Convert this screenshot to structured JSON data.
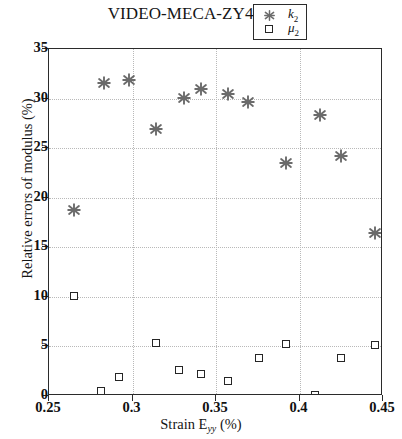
{
  "chart_data": {
    "type": "scatter",
    "title": "VIDEO-MECA-ZY4 N°81",
    "xlabel": "Strain E",
    "xlabel_sub": "yy",
    "xlabel_unit": "(%)",
    "ylabel": "Relative errors of modulus (%)",
    "xlim": [
      0.25,
      0.45
    ],
    "ylim": [
      0,
      35
    ],
    "xticks": [
      "0.25",
      "0.3",
      "0.35",
      "0.4",
      "0.45"
    ],
    "xtick_values": [
      0.25,
      0.3,
      0.35,
      0.4,
      0.45
    ],
    "yticks": [
      "0",
      "5",
      "10",
      "15",
      "20",
      "25",
      "30",
      "35"
    ],
    "ytick_values": [
      0,
      5,
      10,
      15,
      20,
      25,
      30,
      35
    ],
    "grid": true,
    "legend_position": "top-right",
    "series": [
      {
        "name": "k₂",
        "label": "k",
        "label_sub": "2",
        "marker": "asterisk",
        "color": "#6b6b6b",
        "points": [
          {
            "x": 0.265,
            "y": 18.8
          },
          {
            "x": 0.283,
            "y": 31.6
          },
          {
            "x": 0.298,
            "y": 31.9
          },
          {
            "x": 0.314,
            "y": 26.9
          },
          {
            "x": 0.331,
            "y": 30.1
          },
          {
            "x": 0.341,
            "y": 31.0
          },
          {
            "x": 0.357,
            "y": 30.5
          },
          {
            "x": 0.369,
            "y": 29.7
          },
          {
            "x": 0.392,
            "y": 23.5
          },
          {
            "x": 0.412,
            "y": 28.3
          },
          {
            "x": 0.425,
            "y": 24.2
          },
          {
            "x": 0.445,
            "y": 16.4
          }
        ]
      },
      {
        "name": "μ₂",
        "label": "μ",
        "label_sub": "2",
        "marker": "square",
        "color": "#262626",
        "points": [
          {
            "x": 0.265,
            "y": 10.1
          },
          {
            "x": 0.281,
            "y": 0.5
          },
          {
            "x": 0.292,
            "y": 1.9
          },
          {
            "x": 0.314,
            "y": 5.3
          },
          {
            "x": 0.328,
            "y": 2.6
          },
          {
            "x": 0.341,
            "y": 2.2
          },
          {
            "x": 0.357,
            "y": 1.5
          },
          {
            "x": 0.376,
            "y": 3.8
          },
          {
            "x": 0.392,
            "y": 5.2
          },
          {
            "x": 0.409,
            "y": 0.1
          },
          {
            "x": 0.425,
            "y": 3.8
          },
          {
            "x": 0.445,
            "y": 5.1
          }
        ]
      }
    ]
  }
}
